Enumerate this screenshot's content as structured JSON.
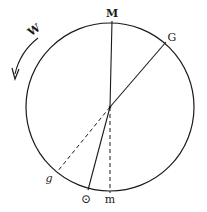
{
  "diagram": {
    "labels": {
      "top": "M",
      "upper_right": "G",
      "lower_left": "g",
      "bottom_left": "⊙",
      "bottom": "m",
      "direction": "W"
    },
    "colors": {
      "stroke": "#1a1a1a",
      "background": "#ffffff"
    }
  }
}
